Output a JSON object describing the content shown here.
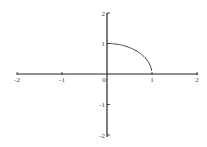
{
  "chart_data": {
    "type": "line",
    "title": "",
    "xlabel": "",
    "ylabel": "",
    "xlim": [
      -2,
      2
    ],
    "ylim": [
      -2,
      2
    ],
    "grid": false,
    "x_ticks": [
      "-2",
      "-1",
      "0",
      "1",
      "2"
    ],
    "y_ticks": [
      "2",
      "1",
      "-1",
      "-2"
    ],
    "series": [
      {
        "name": "curve",
        "x": [
          0,
          0.2,
          0.4,
          0.6,
          0.8,
          0.9,
          0.95,
          1.0
        ],
        "y": [
          1.0,
          0.98,
          0.917,
          0.8,
          0.6,
          0.436,
          0.31,
          0.1
        ]
      }
    ],
    "colors": {
      "axis": "#222222",
      "curve": "#333333"
    }
  }
}
